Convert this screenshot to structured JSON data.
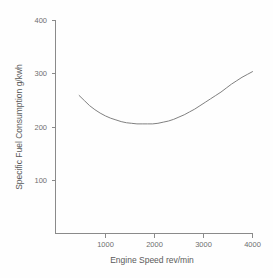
{
  "chart_data": {
    "type": "line",
    "title": "",
    "subtitle": "",
    "xlabel": "Engine Speed rev/min",
    "ylabel": "Specific Fuel Consumption g/kwh",
    "xlim": [
      250,
      4000
    ],
    "ylim": [
      25,
      400
    ],
    "xticks": [
      1000,
      2000,
      3000,
      4000
    ],
    "xtick_labels": [
      "1000",
      "2000",
      "3000",
      "4000"
    ],
    "yticks": [
      100,
      200,
      300,
      400
    ],
    "ytick_labels": [
      "100",
      "200",
      "300",
      "400"
    ],
    "grid": false,
    "legend": false,
    "legend_position": "none",
    "series": [
      {
        "name": "Specific Fuel Consumption",
        "color": "#808080",
        "x": [
          700,
          800,
          900,
          1000,
          1100,
          1200,
          1300,
          1400,
          1500,
          1600,
          1700,
          1800,
          1900,
          2000,
          2100,
          2200,
          2300,
          2400,
          2500,
          2600,
          2700,
          2800,
          2900,
          3000,
          3100,
          3200,
          3300,
          3400,
          3500,
          3600,
          3700,
          3800,
          3900,
          4000
        ],
        "y": [
          268,
          259,
          250,
          243,
          237,
          232,
          228,
          225,
          222,
          220,
          219,
          218,
          218,
          218,
          218,
          219,
          221,
          223,
          226,
          230,
          234,
          239,
          244,
          250,
          256,
          262,
          268,
          274,
          281,
          288,
          294,
          300,
          305,
          310
        ]
      }
    ]
  },
  "axis_tick_labels": {
    "y_400": "400",
    "y_300": "300",
    "y_200": "200",
    "y_100": "100",
    "x_1000": "1000",
    "x_2000": "2000",
    "x_3000": "3000",
    "x_4000": "4000"
  },
  "axis_titles": {
    "x": "Engine Speed rev/min",
    "y": "Specific Fuel Consumption g/kwh"
  },
  "colors": {
    "background": "#fefefe",
    "axis": "#8a8a8a",
    "text": "#6e6e6e",
    "curve": "#808080"
  }
}
